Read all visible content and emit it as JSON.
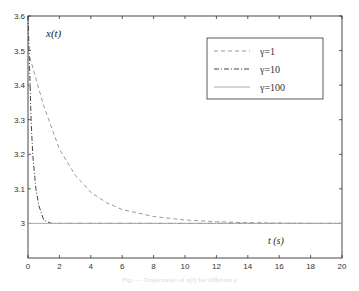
{
  "chart_data": {
    "type": "line",
    "title": "",
    "xlabel": "t (s)",
    "ylabel": "x(t)",
    "xlim": [
      0,
      20
    ],
    "ylim": [
      2.9,
      3.6
    ],
    "xticks": [
      0,
      2,
      4,
      6,
      8,
      10,
      12,
      14,
      16,
      18,
      20
    ],
    "yticks": [
      3,
      3.1,
      3.2,
      3.3,
      3.4,
      3.5,
      3.6
    ],
    "ytick_labels": [
      "3",
      "3.1",
      "3.2",
      "3.3",
      "3.4",
      "3.5",
      "3.6"
    ],
    "grid": false,
    "legend_position": "upper right",
    "series": [
      {
        "name": "γ=1",
        "style": "dashed",
        "x": [
          0,
          1,
          2,
          3,
          4,
          5,
          6,
          8,
          10,
          12,
          14,
          16,
          18,
          20
        ],
        "y": [
          3.5,
          3.34,
          3.215,
          3.14,
          3.09,
          3.06,
          3.04,
          3.02,
          3.01,
          3.005,
          3.002,
          3.001,
          3.0,
          3.0
        ]
      },
      {
        "name": "γ=10",
        "style": "dash-dot",
        "x": [
          0,
          0.1,
          0.2,
          0.3,
          0.5,
          0.7,
          1.0,
          1.5,
          2,
          20
        ],
        "y": [
          3.6,
          3.45,
          3.3,
          3.2,
          3.1,
          3.05,
          3.01,
          3.0,
          3.0,
          3.0
        ]
      },
      {
        "name": "γ=100",
        "style": "solid",
        "x": [
          0,
          0.05,
          20
        ],
        "y": [
          3.0,
          3.0,
          3.0
        ]
      }
    ]
  },
  "labels": {
    "ylabel": "x(t)",
    "xlabel": "t (s)"
  },
  "legend": [
    {
      "label": "γ=1"
    },
    {
      "label": "γ=10"
    },
    {
      "label": "γ=100"
    }
  ],
  "caption": "Fig. — Trajectories of x(t) for different γ"
}
